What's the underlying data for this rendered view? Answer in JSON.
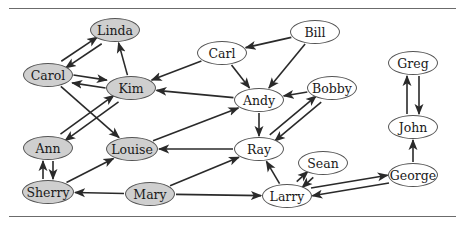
{
  "figure": {
    "type": "directed-graph",
    "colors": {
      "gray_node": "#cfcfcf",
      "white_node": "#ffffff",
      "edge": "#2a2a2a",
      "rule": "#6b6b6b"
    },
    "nodes": [
      {
        "id": "linda",
        "label": "Linda",
        "fill": "gray",
        "x": 115,
        "y": 30,
        "w": 50,
        "h": 24
      },
      {
        "id": "carol",
        "label": "Carol",
        "fill": "gray",
        "x": 48,
        "y": 75,
        "w": 50,
        "h": 24
      },
      {
        "id": "kim",
        "label": "Kim",
        "fill": "gray",
        "x": 131,
        "y": 88,
        "w": 50,
        "h": 24
      },
      {
        "id": "ann",
        "label": "Ann",
        "fill": "gray",
        "x": 48,
        "y": 148,
        "w": 50,
        "h": 24
      },
      {
        "id": "louise",
        "label": "Louise",
        "fill": "gray",
        "x": 132,
        "y": 149,
        "w": 52,
        "h": 24
      },
      {
        "id": "sherry",
        "label": "Sherry",
        "fill": "gray",
        "x": 48,
        "y": 192,
        "w": 52,
        "h": 24
      },
      {
        "id": "mary",
        "label": "Mary",
        "fill": "gray",
        "x": 150,
        "y": 194,
        "w": 50,
        "h": 24
      },
      {
        "id": "carl",
        "label": "Carl",
        "fill": "white",
        "x": 222,
        "y": 53,
        "w": 50,
        "h": 24
      },
      {
        "id": "bill",
        "label": "Bill",
        "fill": "white",
        "x": 315,
        "y": 32,
        "w": 50,
        "h": 24
      },
      {
        "id": "andy",
        "label": "Andy",
        "fill": "white",
        "x": 259,
        "y": 100,
        "w": 50,
        "h": 24
      },
      {
        "id": "bobby",
        "label": "Bobby",
        "fill": "white",
        "x": 332,
        "y": 88,
        "w": 50,
        "h": 24
      },
      {
        "id": "ray",
        "label": "Ray",
        "fill": "white",
        "x": 259,
        "y": 149,
        "w": 50,
        "h": 24
      },
      {
        "id": "sean",
        "label": "Sean",
        "fill": "white",
        "x": 323,
        "y": 163,
        "w": 50,
        "h": 24
      },
      {
        "id": "larry",
        "label": "Larry",
        "fill": "white",
        "x": 287,
        "y": 196,
        "w": 50,
        "h": 24
      },
      {
        "id": "george",
        "label": "George",
        "fill": "white",
        "x": 413,
        "y": 175,
        "w": 50,
        "h": 24
      },
      {
        "id": "john",
        "label": "John",
        "fill": "white",
        "x": 413,
        "y": 127,
        "w": 50,
        "h": 24
      },
      {
        "id": "greg",
        "label": "Greg",
        "fill": "white",
        "x": 413,
        "y": 63,
        "w": 50,
        "h": 24
      }
    ],
    "edges": [
      {
        "from": "carol",
        "to": "linda",
        "offset": -4
      },
      {
        "from": "linda",
        "to": "carol",
        "offset": -4
      },
      {
        "from": "kim",
        "to": "linda",
        "offset": 0
      },
      {
        "from": "carol",
        "to": "kim",
        "offset": -4
      },
      {
        "from": "kim",
        "to": "carol",
        "offset": -4
      },
      {
        "from": "carol",
        "to": "louise",
        "offset": 0
      },
      {
        "from": "kim",
        "to": "ann",
        "offset": -4
      },
      {
        "from": "ann",
        "to": "kim",
        "offset": -4
      },
      {
        "from": "ann",
        "to": "sherry",
        "offset": -5
      },
      {
        "from": "sherry",
        "to": "ann",
        "offset": -5
      },
      {
        "from": "sherry",
        "to": "louise",
        "offset": 0
      },
      {
        "from": "mary",
        "to": "sherry",
        "offset": 0
      },
      {
        "from": "mary",
        "to": "ray",
        "offset": 0
      },
      {
        "from": "mary",
        "to": "larry",
        "offset": 0
      },
      {
        "from": "carl",
        "to": "kim",
        "offset": 0
      },
      {
        "from": "bill",
        "to": "carl",
        "offset": 0
      },
      {
        "from": "bill",
        "to": "andy",
        "offset": 0
      },
      {
        "from": "carl",
        "to": "andy",
        "offset": 0
      },
      {
        "from": "andy",
        "to": "kim",
        "offset": 0
      },
      {
        "from": "louise",
        "to": "andy",
        "offset": 0
      },
      {
        "from": "bobby",
        "to": "andy",
        "offset": 0
      },
      {
        "from": "andy",
        "to": "ray",
        "offset": 0
      },
      {
        "from": "ray",
        "to": "bobby",
        "offset": -4
      },
      {
        "from": "bobby",
        "to": "ray",
        "offset": -4
      },
      {
        "from": "ray",
        "to": "louise",
        "offset": 0
      },
      {
        "from": "larry",
        "to": "ray",
        "offset": 0
      },
      {
        "from": "larry",
        "to": "sean",
        "offset": -4
      },
      {
        "from": "sean",
        "to": "larry",
        "offset": -4
      },
      {
        "from": "larry",
        "to": "george",
        "offset": -4
      },
      {
        "from": "george",
        "to": "larry",
        "offset": -4
      },
      {
        "from": "george",
        "to": "john",
        "offset": 0
      },
      {
        "from": "john",
        "to": "greg",
        "offset": -6
      },
      {
        "from": "greg",
        "to": "john",
        "offset": -6
      }
    ]
  }
}
